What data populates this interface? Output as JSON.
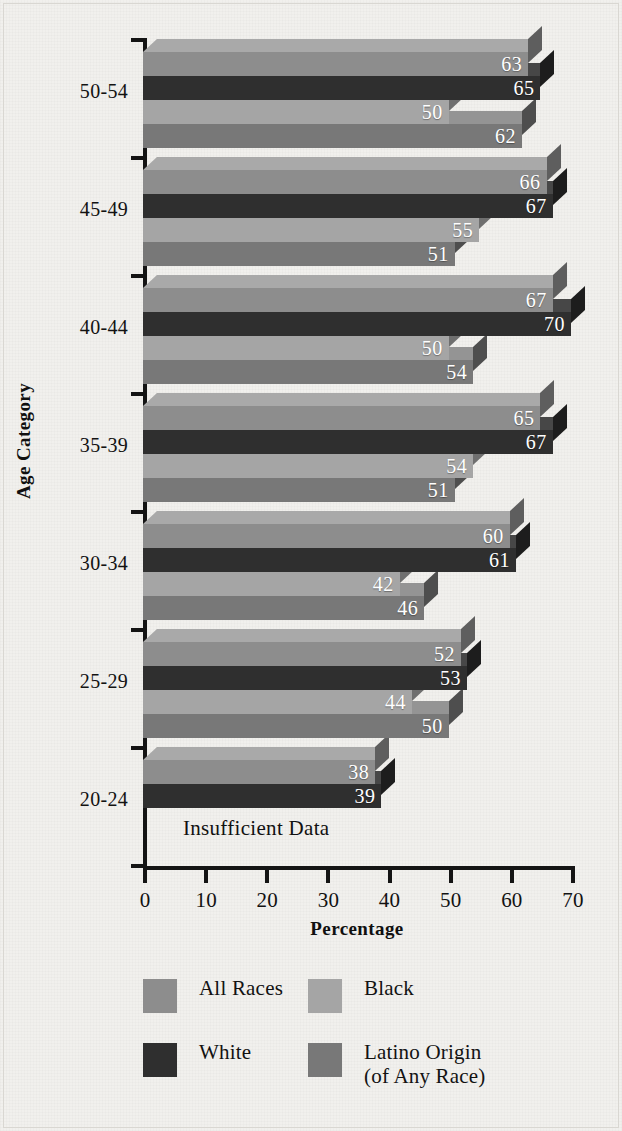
{
  "chart_data": {
    "type": "bar",
    "orientation": "horizontal",
    "title": "",
    "xlabel": "Percentage",
    "ylabel": "Age Category",
    "xlim": [
      0,
      70
    ],
    "xticks": [
      0,
      10,
      20,
      30,
      40,
      50,
      60,
      70
    ],
    "grid": false,
    "legend_position": "bottom",
    "categories": [
      "20-24",
      "25-29",
      "30-34",
      "35-39",
      "40-44",
      "45-49",
      "50-54"
    ],
    "categories_top_to_bottom": [
      "50-54",
      "45-49",
      "40-44",
      "35-39",
      "30-34",
      "25-29",
      "20-24"
    ],
    "series": [
      {
        "name": "All Races",
        "color": "#8d8d8d",
        "values_top_to_bottom": [
          63,
          66,
          67,
          65,
          60,
          52,
          38
        ]
      },
      {
        "name": "White",
        "color": "#2f2f2f",
        "values_top_to_bottom": [
          65,
          67,
          70,
          67,
          61,
          53,
          39
        ]
      },
      {
        "name": "Black",
        "color": "#a5a5a5",
        "values_top_to_bottom": [
          50,
          55,
          50,
          54,
          42,
          44,
          null
        ]
      },
      {
        "name": "Latino Origin (of Any Race)",
        "color": "#787878",
        "values_top_to_bottom": [
          62,
          51,
          54,
          51,
          46,
          50,
          null
        ]
      }
    ],
    "annotations": [
      {
        "text": "Insufficient Data",
        "category": "20-24",
        "applies_to": [
          "Black",
          "Latino Origin (of Any Race)"
        ]
      }
    ]
  },
  "axes": {
    "x_title": "Percentage",
    "y_title": "Age Category",
    "x_tick_labels": [
      "0",
      "10",
      "20",
      "30",
      "40",
      "50",
      "60",
      "70"
    ],
    "y_tick_labels": [
      "50-54",
      "45-49",
      "40-44",
      "35-39",
      "30-34",
      "25-29",
      "20-24"
    ]
  },
  "groups": [
    {
      "label": "50-54",
      "bars": [
        {
          "series": "All Races",
          "value": 63,
          "label": "63"
        },
        {
          "series": "White",
          "value": 65,
          "label": "65"
        },
        {
          "series": "Black",
          "value": 50,
          "label": "50"
        },
        {
          "series": "Latino Origin (of Any Race)",
          "value": 62,
          "label": "62"
        }
      ]
    },
    {
      "label": "45-49",
      "bars": [
        {
          "series": "All Races",
          "value": 66,
          "label": "66"
        },
        {
          "series": "White",
          "value": 67,
          "label": "67"
        },
        {
          "series": "Black",
          "value": 55,
          "label": "55"
        },
        {
          "series": "Latino Origin (of Any Race)",
          "value": 51,
          "label": "51"
        }
      ]
    },
    {
      "label": "40-44",
      "bars": [
        {
          "series": "All Races",
          "value": 67,
          "label": "67"
        },
        {
          "series": "White",
          "value": 70,
          "label": "70"
        },
        {
          "series": "Black",
          "value": 50,
          "label": "50"
        },
        {
          "series": "Latino Origin (of Any Race)",
          "value": 54,
          "label": "54"
        }
      ]
    },
    {
      "label": "35-39",
      "bars": [
        {
          "series": "All Races",
          "value": 65,
          "label": "65"
        },
        {
          "series": "White",
          "value": 67,
          "label": "67"
        },
        {
          "series": "Black",
          "value": 54,
          "label": "54"
        },
        {
          "series": "Latino Origin (of Any Race)",
          "value": 51,
          "label": "51"
        }
      ]
    },
    {
      "label": "30-34",
      "bars": [
        {
          "series": "All Races",
          "value": 60,
          "label": "60"
        },
        {
          "series": "White",
          "value": 61,
          "label": "61"
        },
        {
          "series": "Black",
          "value": 42,
          "label": "42"
        },
        {
          "series": "Latino Origin (of Any Race)",
          "value": 46,
          "label": "46"
        }
      ]
    },
    {
      "label": "25-29",
      "bars": [
        {
          "series": "All Races",
          "value": 52,
          "label": "52"
        },
        {
          "series": "White",
          "value": 53,
          "label": "53"
        },
        {
          "series": "Black",
          "value": 44,
          "label": "44"
        },
        {
          "series": "Latino Origin (of Any Race)",
          "value": 50,
          "label": "50"
        }
      ]
    },
    {
      "label": "20-24",
      "bars": [
        {
          "series": "All Races",
          "value": 38,
          "label": "38"
        },
        {
          "series": "White",
          "value": 39,
          "label": "39"
        },
        {
          "series": "Black",
          "value": null,
          "label": ""
        },
        {
          "series": "Latino Origin (of Any Race)",
          "value": null,
          "label": ""
        }
      ],
      "note": "Insufficient Data"
    }
  ],
  "legend": {
    "items": [
      {
        "label": "All Races",
        "sub": "",
        "color": "#8d8d8d"
      },
      {
        "label": "Black",
        "sub": "",
        "color": "#a5a5a5"
      },
      {
        "label": "White",
        "sub": "",
        "color": "#2f2f2f"
      },
      {
        "label": "Latino Origin",
        "sub": "(of Any Race)",
        "color": "#787878"
      }
    ]
  }
}
